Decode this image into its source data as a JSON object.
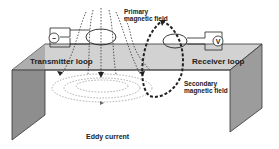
{
  "labels": {
    "transmitter": "Transmitter loop",
    "receiver": "Receiver loop",
    "primary_line1": "Primary",
    "primary_line2": "magnetic field",
    "secondary_line1": "Secondary",
    "secondary_line2": "magnetic field",
    "eddy": "Eddy current"
  },
  "icons": {
    "source": "ac-source-icon",
    "meter": "voltmeter-icon",
    "meter_symbol": "V",
    "source_symbol": "~"
  },
  "colors": {
    "ground_top": "#d4d4d4",
    "ground_top_dark": "#b8b8b8",
    "left_wall": "#8c8c8c",
    "right_wall": "#9a9a9a",
    "line": "#222222",
    "dotted_field": "#555555",
    "eddy": "#8a8a8a"
  }
}
